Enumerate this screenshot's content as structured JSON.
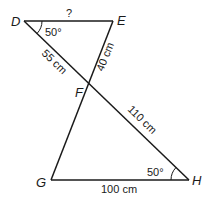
{
  "diagram": {
    "points": {
      "D": {
        "label": "D",
        "x": 24,
        "y": 21
      },
      "E": {
        "label": "E",
        "x": 113,
        "y": 21
      },
      "F": {
        "label": "F",
        "x": 88,
        "y": 84
      },
      "G": {
        "label": "G",
        "x": 51,
        "y": 180
      },
      "H": {
        "label": "H",
        "x": 189,
        "y": 180
      }
    },
    "segments": [
      {
        "from": "D",
        "to": "E",
        "label": "?"
      },
      {
        "from": "D",
        "to": "F",
        "label": "55 cm"
      },
      {
        "from": "E",
        "to": "F",
        "label": "40 cm"
      },
      {
        "from": "F",
        "to": "H",
        "label": "110 cm"
      },
      {
        "from": "G",
        "to": "H",
        "label": "100 cm"
      },
      {
        "from": "F",
        "to": "G",
        "label": ""
      }
    ],
    "angles": {
      "D": {
        "label": "50°"
      },
      "H": {
        "label": "50°"
      }
    },
    "labels": {
      "de": "?",
      "df": "55 cm",
      "ef": "40 cm",
      "fh": "110 cm",
      "gh": "100 cm",
      "angle_d": "50°",
      "angle_h": "50°",
      "pt_d": "D",
      "pt_e": "E",
      "pt_f": "F",
      "pt_g": "G",
      "pt_h": "H"
    },
    "line_color": "#1a1a1a"
  }
}
